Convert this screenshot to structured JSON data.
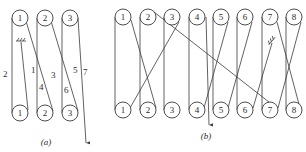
{
  "diagram_a": {
    "caption": "(a)",
    "top_rollers": [
      "1",
      "2",
      "3"
    ],
    "bottom_rollers": [
      "1",
      "2",
      "3"
    ],
    "segment_labels": [
      "1",
      "2",
      "3",
      "4",
      "5",
      "6",
      "7"
    ]
  },
  "diagram_b": {
    "caption": "(b)",
    "top_rollers": [
      "1",
      "2",
      "3",
      "4",
      "5",
      "6",
      "7",
      "8"
    ],
    "bottom_rollers": [
      "1",
      "2",
      "3",
      "4",
      "5",
      "6",
      "7",
      "8"
    ]
  },
  "colors": {
    "line": "#3a3a3a",
    "background": "#ffffff"
  }
}
